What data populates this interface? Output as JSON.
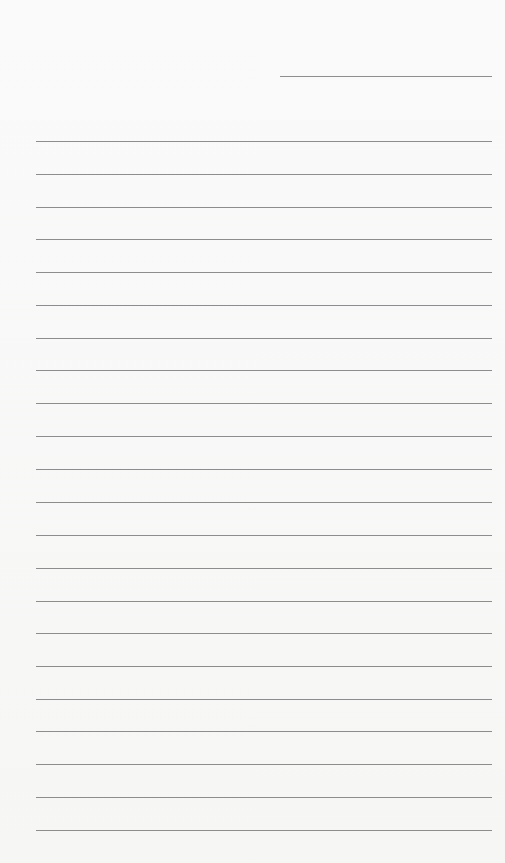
{
  "document": {
    "type": "lined-writing-form",
    "header_line": {
      "x": 280,
      "y": 76,
      "width": 212,
      "value": ""
    },
    "body_lines": {
      "x": 36,
      "width": 456,
      "positions": [
        141,
        174,
        207,
        239,
        272,
        305,
        338,
        370,
        403,
        436,
        469,
        502,
        535,
        568,
        601,
        633,
        666,
        699,
        731,
        764,
        797,
        830
      ],
      "values": [
        "",
        "",
        "",
        "",
        "",
        "",
        "",
        "",
        "",
        "",
        "",
        "",
        "",
        "",
        "",
        "",
        "",
        "",
        "",
        "",
        "",
        ""
      ]
    },
    "colors": {
      "paper": "#f8f8f7",
      "rule": "#7a7a7a"
    }
  }
}
